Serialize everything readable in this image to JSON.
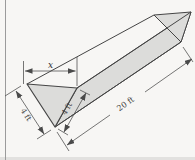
{
  "figure": {
    "labels": {
      "width_top": "x",
      "left_side": "4 ft",
      "right_side": "4 ft",
      "length": "20 ft"
    },
    "colors": {
      "paper": "#f7f6f4",
      "face_fill": "#dcdcda",
      "edge": "#454545",
      "dim_line": "#4a4a4a",
      "page_border": "#9b9b9b",
      "scan_edge": "#e2e1df"
    }
  }
}
